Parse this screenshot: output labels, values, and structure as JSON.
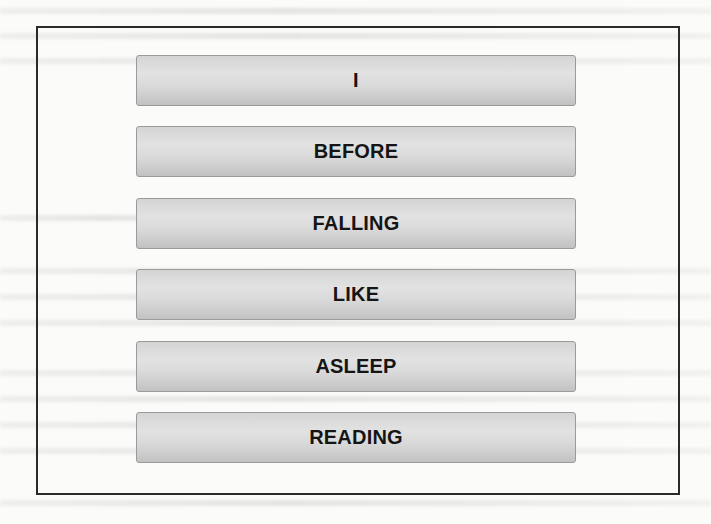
{
  "diagram": {
    "type": "stacked word boxes",
    "words": [
      {
        "label": "I"
      },
      {
        "label": "BEFORE"
      },
      {
        "label": "FALLING"
      },
      {
        "label": "LIKE"
      },
      {
        "label": "ASLEEP"
      },
      {
        "label": "READING"
      }
    ]
  },
  "colors": {
    "frame_border": "#2a2a2a",
    "box_fill": "#d8d8d8",
    "box_border": "#9a9a9a",
    "text": "#151515"
  }
}
